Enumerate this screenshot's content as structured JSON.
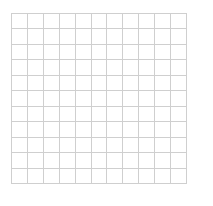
{
  "grid": {
    "rows": 11,
    "cols": 11,
    "line_color": "#cfcfcf",
    "background": "#ffffff"
  }
}
